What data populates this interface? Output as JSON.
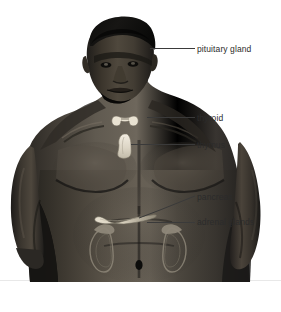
{
  "diagram": {
    "background_color": "#ffffff",
    "label_color": "#2b2b2b",
    "leader_line_color": "#3a3a3a",
    "baseline_rule_color": "#e2e2e2",
    "labels": [
      {
        "id": "pituitary",
        "text": "pituitary gland",
        "leader": {
          "x1": 150,
          "y1": 48,
          "x2": 195,
          "y2": 48
        }
      },
      {
        "id": "thyroid",
        "text": "thyroid",
        "leader": {
          "x1": 147,
          "y1": 117,
          "x2": 195,
          "y2": 117
        }
      },
      {
        "id": "thymus",
        "text": "thymus",
        "leader": {
          "x1": 131,
          "y1": 144,
          "x2": 195,
          "y2": 144
        }
      },
      {
        "id": "pancreas",
        "text": "pancreas",
        "leader": {
          "x1": 139,
          "y1": 218,
          "x2": 195,
          "y2": 196
        }
      },
      {
        "id": "adrenal",
        "text": "adrenal glands",
        "leader": {
          "x1": 147,
          "y1": 222,
          "x2": 195,
          "y2": 222
        }
      }
    ],
    "organs": [
      {
        "id": "thyroid-gland",
        "shape": "butterfly",
        "fill": "#efe6d8"
      },
      {
        "id": "thymus-gland",
        "shape": "lobed-teardrop",
        "fill": "#e8e2d4"
      },
      {
        "id": "pancreas-gland",
        "shape": "elongated-tail",
        "fill": "#ded7c6"
      },
      {
        "id": "adrenal-left",
        "shape": "cap",
        "fill": "#6d6d6d"
      },
      {
        "id": "adrenal-right",
        "shape": "cap",
        "fill": "#6d6d6d"
      },
      {
        "id": "kidney-left",
        "shape": "bean-outline",
        "fill": "none"
      },
      {
        "id": "kidney-right",
        "shape": "bean-outline",
        "fill": "none"
      }
    ]
  }
}
